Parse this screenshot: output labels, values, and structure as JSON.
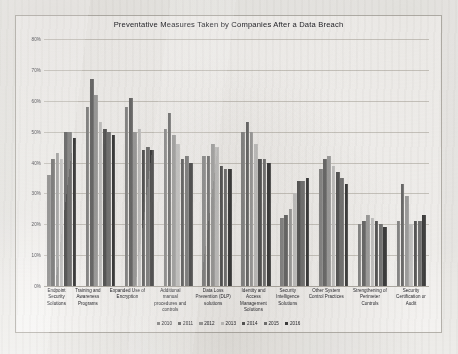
{
  "chart_data": {
    "type": "bar",
    "title": "Preventative Measures Taken by Companies After a Data Breach",
    "xlabel": "",
    "ylabel": "",
    "ylim": [
      0,
      80
    ],
    "ytick_labels": [
      "80%",
      "70%",
      "60%",
      "50%",
      "40%",
      "30%",
      "20%",
      "10%",
      "0%"
    ],
    "ytick_values": [
      80,
      70,
      60,
      50,
      40,
      30,
      20,
      10,
      0
    ],
    "grid": true,
    "legend_position": "bottom",
    "categories": [
      "Endpoint Security Solutions",
      "Training and Awareness Programs",
      "Expanded Use of Encryption",
      "Additional manual procedures and controls",
      "Data Loss Prevention (DLP) solutions",
      "Identity and Access Management Solutions",
      "Security Intelligence Solutions",
      "Other System Control Practices",
      "Strengthening of Perimeter Controls",
      "Security Certification or Audit"
    ],
    "category_lines": [
      [
        "Endpoint",
        "Security",
        "Solutions"
      ],
      [
        "Training and",
        "Awareness",
        "Programs"
      ],
      [
        "Expanded Use of",
        "Encryption"
      ],
      [
        "Additional",
        "manual",
        "procedures and",
        "controls"
      ],
      [
        "Data Loss",
        "Prevention (DLP)",
        "solutions"
      ],
      [
        "Identity and",
        "Access",
        "Management",
        "Solutions"
      ],
      [
        "Security",
        "Intelligence",
        "Solutions"
      ],
      [
        "Other System",
        "Control Practices"
      ],
      [
        "Strengthening of",
        "Perimeter",
        "Controls"
      ],
      [
        "Security",
        "Certification or",
        "Audit"
      ]
    ],
    "series": [
      {
        "name": "2010",
        "color": "#8c8c8c",
        "values": [
          36,
          58,
          58,
          51,
          42,
          50,
          22,
          38,
          20,
          21
        ]
      },
      {
        "name": "2011",
        "color": "#6e6e6e",
        "values": [
          41,
          67,
          61,
          56,
          42,
          53,
          23,
          41,
          21,
          33
        ]
      },
      {
        "name": "2012",
        "color": "#a3a3a3",
        "values": [
          43,
          62,
          50,
          49,
          46,
          50,
          25,
          42,
          23,
          29
        ]
      },
      {
        "name": "2013",
        "color": "#c9c9c9",
        "values": [
          41,
          53,
          51,
          46,
          45,
          46,
          30,
          39,
          22,
          20
        ]
      },
      {
        "name": "2014",
        "color": "#5a5a5a",
        "values": [
          50,
          51,
          44,
          41,
          39,
          41,
          34,
          37,
          21,
          21
        ]
      },
      {
        "name": "2015",
        "color": "#787878",
        "values": [
          50,
          50,
          45,
          42,
          38,
          41,
          34,
          35,
          20,
          21
        ]
      },
      {
        "name": "2016",
        "color": "#3f3f3f",
        "values": [
          48,
          49,
          44,
          40,
          38,
          40,
          35,
          33,
          19,
          23
        ]
      }
    ]
  },
  "legend": {
    "items": [
      {
        "label": "2010"
      },
      {
        "label": "2011"
      },
      {
        "label": "2012"
      },
      {
        "label": "2013"
      },
      {
        "label": "2014"
      },
      {
        "label": "2015"
      },
      {
        "label": "2016"
      }
    ]
  }
}
